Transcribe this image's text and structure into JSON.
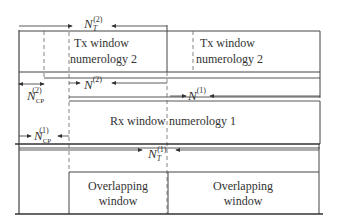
{
  "diagram": {
    "labels": {
      "nt2": {
        "base": "N",
        "sub": "T",
        "sup": "(2)"
      },
      "n2": {
        "base": "N",
        "sup": "(2)"
      },
      "ncp2": {
        "base": "N",
        "sub": "CP",
        "sup": "(2)"
      },
      "n1": {
        "base": "N",
        "sup": "(1)"
      },
      "ncp1": {
        "base": "N",
        "sub": "CP",
        "sup": "(1)"
      },
      "nt1": {
        "base": "N",
        "sub": "T",
        "sup": "(1)"
      }
    },
    "tx_window_1": {
      "line1": "Tx window",
      "line2": "numerology 2"
    },
    "tx_window_2": {
      "line1": "Tx window",
      "line2": "numerology 2"
    },
    "rx_window": {
      "text_left": "Rx window",
      "text_right": "numerology 1"
    },
    "overlap_1": {
      "line1": "Overlapping",
      "line2": "window"
    },
    "overlap_2": {
      "line1": "Overlapping",
      "line2": "window"
    },
    "colors": {
      "line": "#444444",
      "dashed": "#666666",
      "text": "#333333"
    }
  }
}
